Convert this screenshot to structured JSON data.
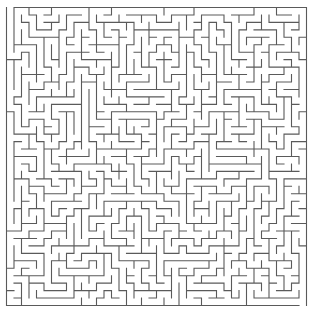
{
  "title": "Maze",
  "maze": {
    "cols": 40,
    "rows": 40,
    "origin_x": 6.5,
    "origin_y": 7.5,
    "cell_w": 7.5,
    "cell_h": 7.45,
    "wall_color": "#5a5a5a",
    "wall_width": 1.1,
    "background": "#ffffff",
    "entrance": {
      "side": "top",
      "col": 0
    },
    "exit": {
      "side": "bottom",
      "col": 39
    },
    "seed": 20240517
  }
}
